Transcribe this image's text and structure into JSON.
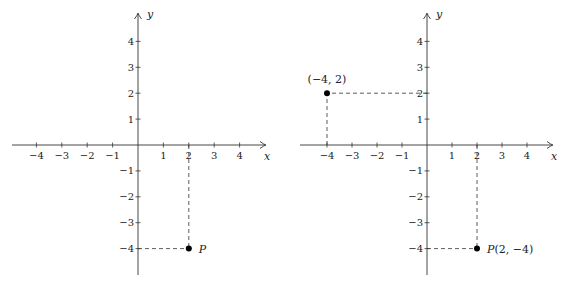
{
  "figure": {
    "panels": [
      {
        "id": "left",
        "origin": [
          138,
          145
        ],
        "unit_x": 25.4,
        "unit_y": 25.9,
        "x_axis": {
          "label": "x",
          "from": 12,
          "to": 266,
          "ticks": [
            -4,
            -3,
            -2,
            -1,
            1,
            2,
            3,
            4
          ]
        },
        "y_axis": {
          "label": "y",
          "from": 275,
          "to": 13,
          "ticks": [
            -4,
            -3,
            -2,
            -1,
            1,
            2,
            3,
            4
          ]
        },
        "points": [
          {
            "x": 2,
            "y": -4,
            "label": "P",
            "label_pos": "right",
            "guides": true
          }
        ]
      },
      {
        "id": "right",
        "origin": [
          427,
          145
        ],
        "unit_x": 25.0,
        "unit_y": 25.9,
        "x_axis": {
          "label": "x",
          "from": 300,
          "to": 553,
          "ticks": [
            -4,
            -3,
            -2,
            -1,
            1,
            2,
            3,
            4
          ]
        },
        "y_axis": {
          "label": "y",
          "from": 275,
          "to": 13,
          "ticks": [
            -4,
            -3,
            -2,
            -1,
            1,
            2,
            3,
            4
          ]
        },
        "points": [
          {
            "x": -4,
            "y": 2,
            "label": "(−4, 2)",
            "label_pos": "above",
            "guides": true
          },
          {
            "x": 2,
            "y": -4,
            "label": "P(2, −4)",
            "label_pos": "right",
            "guides": true
          }
        ]
      }
    ]
  }
}
